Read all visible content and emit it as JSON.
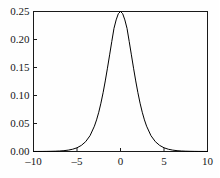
{
  "chart_data": {
    "type": "line",
    "title": "",
    "subtitle": "",
    "xlabel": "",
    "ylabel": "",
    "xlim": [
      -10,
      10
    ],
    "ylim": [
      0.0,
      0.25
    ],
    "grid": false,
    "legend": null,
    "annotations": [],
    "xticks": [
      -10,
      -5,
      0,
      5,
      10
    ],
    "xtick_labels": [
      "–10",
      "–5",
      "0",
      "5",
      "10"
    ],
    "yticks": [
      0.0,
      0.05,
      0.1,
      0.15,
      0.2,
      0.25
    ],
    "ytick_labels": [
      "0.00",
      "0.05",
      "0.10",
      "0.15",
      "0.20",
      "0.25"
    ],
    "series": [
      {
        "name": "logistic-density",
        "color": "#000000",
        "linewidth": 1,
        "x": [
          -10,
          -9.5,
          -9,
          -8.5,
          -8,
          -7.5,
          -7,
          -6.5,
          -6,
          -5.5,
          -5,
          -4.5,
          -4,
          -3.5,
          -3,
          -2.75,
          -2.5,
          -2.25,
          -2,
          -1.75,
          -1.5,
          -1.25,
          -1,
          -0.75,
          -0.5,
          -0.25,
          0,
          0.25,
          0.5,
          0.75,
          1,
          1.25,
          1.5,
          1.75,
          2,
          2.25,
          2.5,
          2.75,
          3,
          3.5,
          4,
          4.5,
          5,
          5.5,
          6,
          6.5,
          7,
          7.5,
          8,
          8.5,
          9,
          9.5,
          10
        ],
        "y": [
          4.54e-05,
          7.49e-05,
          0.0001234,
          0.0002034,
          0.0003353,
          0.0005526,
          0.0009104,
          0.0014994,
          0.0024665,
          0.0040504,
          0.006648,
          0.0108888,
          0.0176627,
          0.0283385,
          0.0451767,
          0.0564619,
          0.0701037,
          0.0862871,
          0.1049936,
          0.1259844,
          0.1487621,
          0.1725939,
          0.1966119,
          0.2198682,
          0.2350037,
          0.246134,
          0.25,
          0.246134,
          0.2350037,
          0.2198682,
          0.1966119,
          0.1725939,
          0.1487621,
          0.1259844,
          0.1049936,
          0.0862871,
          0.0701037,
          0.0564619,
          0.0451767,
          0.0283385,
          0.0176627,
          0.0108888,
          0.006648,
          0.0040504,
          0.0024665,
          0.0014994,
          0.0009104,
          0.0005526,
          0.0003353,
          0.0002034,
          0.0001234,
          7.49e-05,
          4.54e-05
        ]
      }
    ]
  },
  "axes": {
    "frame_color": "#1a1a1a",
    "background": "#fefefe"
  }
}
